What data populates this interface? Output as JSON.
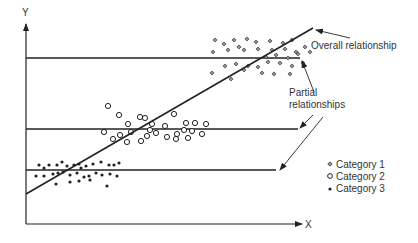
{
  "axes": {
    "y_label": "Y",
    "x_label": "X"
  },
  "annotations": {
    "overall": "Overall relationship",
    "partial_line1": "Partial",
    "partial_line2": "relationships"
  },
  "legend": [
    {
      "label": "Category 1",
      "marker": "diamond-cross"
    },
    {
      "label": "Category 2",
      "marker": "open-circle"
    },
    {
      "label": "Category 3",
      "marker": "filled-dot"
    }
  ],
  "colors": {
    "ink": "#222222",
    "text": "#333333"
  },
  "clusters": {
    "category1": [
      [
        215,
        40
      ],
      [
        224,
        44
      ],
      [
        234,
        40
      ],
      [
        247,
        39
      ],
      [
        256,
        42
      ],
      [
        270,
        41
      ],
      [
        283,
        43
      ],
      [
        292,
        40
      ],
      [
        239,
        47
      ],
      [
        213,
        52
      ],
      [
        228,
        50
      ],
      [
        244,
        50
      ],
      [
        258,
        49
      ],
      [
        272,
        50
      ],
      [
        285,
        49
      ],
      [
        296,
        52
      ],
      [
        305,
        47
      ],
      [
        310,
        52
      ],
      [
        266,
        57
      ],
      [
        276,
        55
      ],
      [
        288,
        58
      ],
      [
        298,
        54
      ],
      [
        225,
        66
      ],
      [
        236,
        64
      ],
      [
        248,
        66
      ],
      [
        258,
        67
      ],
      [
        268,
        62
      ],
      [
        280,
        63
      ],
      [
        292,
        66
      ],
      [
        303,
        63
      ],
      [
        212,
        73
      ],
      [
        244,
        70
      ],
      [
        262,
        73
      ],
      [
        274,
        74
      ],
      [
        290,
        74
      ],
      [
        231,
        79
      ]
    ],
    "category2": [
      [
        108,
        106
      ],
      [
        119,
        115
      ],
      [
        140,
        117
      ],
      [
        174,
        114
      ],
      [
        128,
        124
      ],
      [
        152,
        124
      ],
      [
        145,
        118
      ],
      [
        186,
        123
      ],
      [
        165,
        126
      ],
      [
        195,
        123
      ],
      [
        206,
        124
      ],
      [
        104,
        132
      ],
      [
        120,
        135
      ],
      [
        131,
        132
      ],
      [
        147,
        136
      ],
      [
        156,
        133
      ],
      [
        167,
        137
      ],
      [
        177,
        134
      ],
      [
        184,
        130
      ],
      [
        192,
        131
      ],
      [
        202,
        134
      ],
      [
        113,
        139
      ],
      [
        127,
        142
      ],
      [
        141,
        141
      ],
      [
        150,
        130
      ],
      [
        176,
        139
      ],
      [
        188,
        138
      ]
    ],
    "category3": [
      [
        39,
        165
      ],
      [
        44,
        168
      ],
      [
        49,
        165
      ],
      [
        57,
        165
      ],
      [
        62,
        162
      ],
      [
        67,
        166
      ],
      [
        74,
        165
      ],
      [
        79,
        164
      ],
      [
        81,
        168
      ],
      [
        86,
        166
      ],
      [
        93,
        164
      ],
      [
        101,
        162
      ],
      [
        109,
        165
      ],
      [
        114,
        165
      ],
      [
        119,
        163
      ],
      [
        36,
        176
      ],
      [
        44,
        176
      ],
      [
        53,
        174
      ],
      [
        58,
        173
      ],
      [
        63,
        172
      ],
      [
        70,
        175
      ],
      [
        77,
        173
      ],
      [
        84,
        177
      ],
      [
        89,
        176
      ],
      [
        96,
        173
      ],
      [
        102,
        175
      ],
      [
        110,
        174
      ],
      [
        117,
        176
      ],
      [
        70,
        182
      ],
      [
        79,
        181
      ],
      [
        90,
        180
      ],
      [
        107,
        186
      ],
      [
        56,
        184
      ]
    ]
  }
}
